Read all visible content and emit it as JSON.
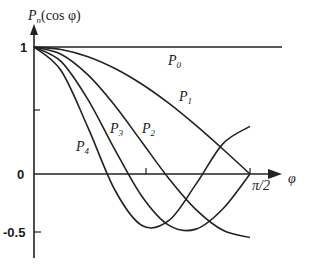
{
  "chart_data": {
    "type": "line",
    "title": "",
    "xlabel": "φ",
    "ylabel": "P_n(cos φ)",
    "x_tick_labels": [
      "π/2"
    ],
    "y_tick_labels": [
      "1",
      "0",
      "-0.5"
    ],
    "xlim": [
      0,
      1.5708
    ],
    "ylim": [
      -0.65,
      1.1
    ],
    "grid": false,
    "x": [
      0,
      0.19635,
      0.3927,
      0.58905,
      0.7854,
      0.98175,
      1.1781,
      1.37445,
      1.5708
    ],
    "series": [
      {
        "name": "P0",
        "values": [
          1,
          1,
          1,
          1,
          1,
          1,
          1,
          1,
          1
        ]
      },
      {
        "name": "P1",
        "values": [
          1,
          0.981,
          0.924,
          0.831,
          0.707,
          0.556,
          0.383,
          0.195,
          0
        ]
      },
      {
        "name": "P2",
        "values": [
          1,
          0.943,
          0.78,
          0.537,
          0.25,
          -0.037,
          -0.28,
          -0.443,
          -0.5
        ]
      },
      {
        "name": "P3",
        "values": [
          1,
          0.887,
          0.586,
          0.19,
          -0.177,
          -0.405,
          -0.434,
          -0.274,
          0
        ]
      },
      {
        "name": "P4",
        "values": [
          1,
          0.815,
          0.365,
          -0.128,
          -0.406,
          -0.366,
          -0.08,
          0.239,
          0.375
        ]
      }
    ],
    "curve_labels": [
      "P0",
      "P1",
      "P2",
      "P3",
      "P4"
    ]
  },
  "labels": {
    "y_axis": "P",
    "y_axis_sub": "n",
    "y_axis_rest": "(cos φ)",
    "x_axis": "φ",
    "tick_one": "1",
    "tick_zero": "0",
    "tick_neg_half": "-0.5",
    "tick_pi_half": "π/2",
    "p0": "P",
    "p0_sub": "0",
    "p1": "P",
    "p1_sub": "1",
    "p2": "P",
    "p2_sub": "2",
    "p3": "P",
    "p3_sub": "3",
    "p4": "P",
    "p4_sub": "4"
  }
}
